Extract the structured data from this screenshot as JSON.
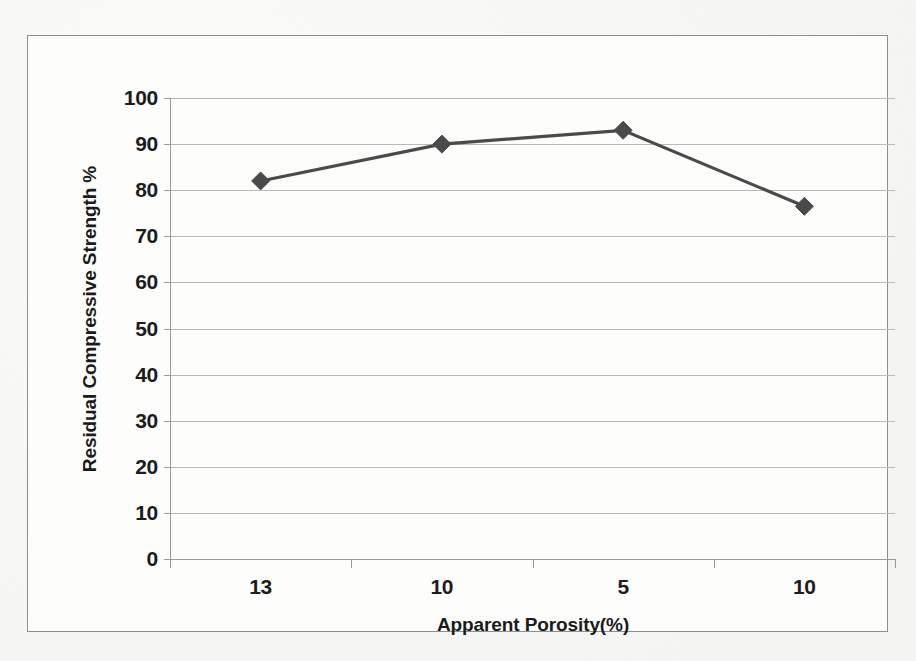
{
  "chart_data": {
    "type": "line",
    "title": "",
    "xlabel": "Apparent Porosity(%)",
    "ylabel": "Residual Compressive Strength %",
    "categories": [
      "13",
      "10",
      "5",
      "10"
    ],
    "values": [
      82,
      90,
      93,
      76.5
    ],
    "series": [
      {
        "name": "Residual Compressive Strength %",
        "values": [
          82,
          90,
          93,
          76.5
        ]
      }
    ],
    "ylim": [
      0,
      100
    ],
    "ytick_labels": [
      "0",
      "10",
      "20",
      "30",
      "40",
      "50",
      "60",
      "70",
      "80",
      "90",
      "100"
    ],
    "ytick_values": [
      0,
      10,
      20,
      30,
      40,
      50,
      60,
      70,
      80,
      90,
      100
    ],
    "grid": "horizontal",
    "legend": "none",
    "marker": "diamond",
    "line_color": "#4a4a4a",
    "marker_color": "#4a4a4a",
    "gridline_color": "#b9b9b9",
    "axis_color": "#9a9a9a",
    "text_color": "#1c1c1c",
    "background_color": "#fdfdfc",
    "frame_color": "#8e8e8e"
  }
}
